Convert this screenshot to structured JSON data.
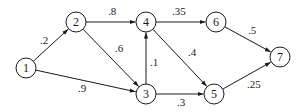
{
  "diagram": {
    "type": "directed-weighted-graph",
    "colors": {
      "stroke": "#1a1a1a",
      "background": "#ffffff"
    },
    "node_radius": 10,
    "nodes": [
      {
        "id": "1",
        "label": "1",
        "x": 26,
        "y": 68
      },
      {
        "id": "2",
        "label": "2",
        "x": 76,
        "y": 22
      },
      {
        "id": "3",
        "label": "3",
        "x": 146,
        "y": 94
      },
      {
        "id": "4",
        "label": "4",
        "x": 146,
        "y": 22
      },
      {
        "id": "5",
        "label": "5",
        "x": 214,
        "y": 94
      },
      {
        "id": "6",
        "label": "6",
        "x": 216,
        "y": 22
      },
      {
        "id": "7",
        "label": "7",
        "x": 280,
        "y": 57
      }
    ],
    "edges": [
      {
        "from": "1",
        "to": "2",
        "label": ".2",
        "lx": 40,
        "ly": 44
      },
      {
        "from": "1",
        "to": "3",
        "label": ".9",
        "lx": 78,
        "ly": 92
      },
      {
        "from": "2",
        "to": "4",
        "label": ".8",
        "lx": 108,
        "ly": 15
      },
      {
        "from": "2",
        "to": "3",
        "label": ".6",
        "lx": 115,
        "ly": 52
      },
      {
        "from": "3",
        "to": "4",
        "label": ".1",
        "lx": 150,
        "ly": 66
      },
      {
        "from": "3",
        "to": "5",
        "label": ".3",
        "lx": 177,
        "ly": 106
      },
      {
        "from": "4",
        "to": "6",
        "label": ".35",
        "lx": 172,
        "ly": 15
      },
      {
        "from": "4",
        "to": "5",
        "label": ".4",
        "lx": 188,
        "ly": 56
      },
      {
        "from": "6",
        "to": "7",
        "label": ".5",
        "lx": 248,
        "ly": 34
      },
      {
        "from": "5",
        "to": "7",
        "label": ".25",
        "lx": 247,
        "ly": 88
      }
    ]
  }
}
